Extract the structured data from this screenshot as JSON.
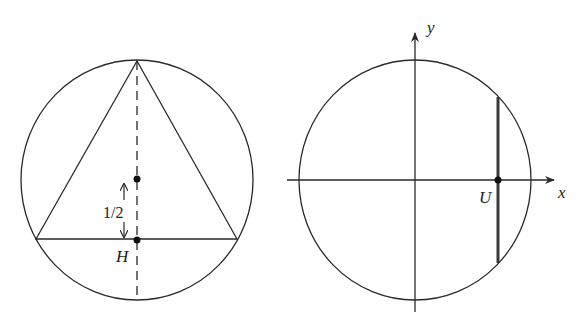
{
  "left_figure": {
    "title": "Inscribed equilateral triangle",
    "circle": {
      "cx": 137,
      "cy": 180,
      "rx": 116,
      "ry": 120
    },
    "triangle": {
      "top": [
        137,
        61
      ],
      "left": [
        36,
        239
      ],
      "right": [
        237,
        239
      ]
    },
    "dashed_line": {
      "x": 137,
      "y1": 61,
      "y2": 300
    },
    "center_point": [
      137,
      179
    ],
    "foot_point": [
      137,
      240
    ],
    "distance_label": "1/2",
    "foot_label": "H"
  },
  "right_figure": {
    "title": "Unit circle with chord",
    "circle": {
      "cx": 415,
      "cy": 180,
      "rx": 116,
      "ry": 120
    },
    "x_axis_label": "x",
    "y_axis_label": "y",
    "chord": {
      "x": 498,
      "y1": 97,
      "y2": 263
    },
    "point": [
      498,
      180
    ],
    "point_label": "U"
  },
  "colors": {
    "line": "#2a2a2a",
    "chord": "#3a3a3a",
    "background": "#ffffff"
  }
}
